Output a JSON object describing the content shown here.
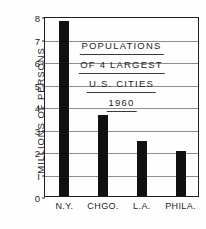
{
  "chart_data": {
    "type": "bar",
    "title_lines": [
      "POPULATIONS",
      "OF 4 LARGEST",
      "U.S. CITIES",
      "1960"
    ],
    "xlabel": "",
    "ylabel": "MILLIONS OF PERSONS",
    "categories": [
      "N.Y.",
      "CHGO.",
      "L.A.",
      "PHILA."
    ],
    "values": [
      7.8,
      3.6,
      2.45,
      2.0
    ],
    "ylim": [
      0,
      8
    ],
    "ytick_labels": [
      "8",
      "7",
      "6",
      "5",
      "4",
      "3",
      "2",
      "I",
      "0"
    ],
    "ytick_values": [
      8,
      7,
      6,
      5,
      4,
      3,
      2,
      1,
      0
    ],
    "grid": true,
    "legend": false,
    "bar_color": "#111111",
    "axis_color": "#1d1d1d",
    "grid_color": "#8d8d8d",
    "background_color": "#fefefe"
  }
}
